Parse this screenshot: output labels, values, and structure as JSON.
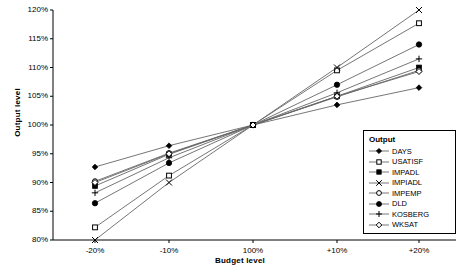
{
  "chart_data": {
    "type": "line",
    "title": "",
    "xlabel": "Budget level",
    "ylabel": "Output level",
    "categories": [
      "-20%",
      "-10%",
      "100%",
      "+10%",
      "+20%"
    ],
    "x_tick_labels": [
      "-20%",
      "-10%",
      "100%",
      "+10%",
      "+20%"
    ],
    "y_tick_labels": [
      "80%",
      "85%",
      "90%",
      "95%",
      "100%",
      "105%",
      "110%",
      "115%",
      "120%"
    ],
    "y_ticks": [
      80,
      85,
      90,
      95,
      100,
      105,
      110,
      115,
      120
    ],
    "ylim": [
      80,
      120
    ],
    "grid": false,
    "legend_position": "bottom-right",
    "legend_title": "Output",
    "series": [
      {
        "name": "DAYS",
        "marker": "filled-diamond",
        "values": [
          92.7,
          96.4,
          100,
          103.5,
          106.5
        ]
      },
      {
        "name": "USATISF",
        "marker": "open-square",
        "values": [
          82.2,
          91.2,
          100,
          109.5,
          117.7
        ]
      },
      {
        "name": "IMPADL",
        "marker": "filled-square",
        "values": [
          89.4,
          94.9,
          100,
          105.0,
          110.0
        ]
      },
      {
        "name": "IMPIADL",
        "marker": "cross-x",
        "values": [
          80.0,
          90.0,
          100,
          110.0,
          120.0
        ]
      },
      {
        "name": "IMPEMP",
        "marker": "open-circle",
        "values": [
          90.2,
          95.1,
          100,
          104.9,
          109.5
        ]
      },
      {
        "name": "DLD",
        "marker": "filled-circle",
        "values": [
          86.4,
          93.4,
          100,
          107.0,
          114.0
        ]
      },
      {
        "name": "KOSBERG",
        "marker": "plus",
        "values": [
          88.2,
          94.3,
          100,
          105.6,
          111.5
        ]
      },
      {
        "name": "WKSAT",
        "marker": "open-diamond",
        "values": [
          90.0,
          95.0,
          100,
          105.0,
          109.3
        ]
      }
    ]
  },
  "legend": {
    "title": "Output",
    "items": [
      {
        "label": "DAYS"
      },
      {
        "label": "USATISF"
      },
      {
        "label": "IMPADL"
      },
      {
        "label": "IMPIADL"
      },
      {
        "label": "IMPEMP"
      },
      {
        "label": "DLD"
      },
      {
        "label": "KOSBERG"
      },
      {
        "label": "WKSAT"
      }
    ]
  },
  "axes": {
    "y_title": "Output level",
    "x_title": "Budget level"
  },
  "colors": {
    "line": "#555555",
    "axis": "#000000",
    "background": "#ffffff"
  }
}
